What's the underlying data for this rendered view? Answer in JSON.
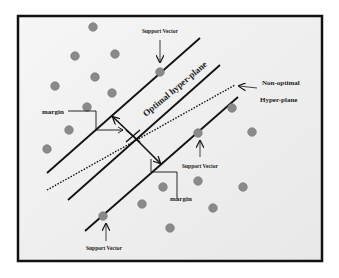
{
  "diagram": {
    "colors": {
      "background": "#f0f0f0",
      "frame": "#111111",
      "line": "#111111",
      "point": "#8a8a8a",
      "point_edge": "#777777"
    },
    "labels": {
      "support_vector_top": "Support Vector",
      "support_vector_mid": "Support Vector",
      "support_vector_bottom": "Support Vector",
      "optimal": "Optimal hyper-plane",
      "non_optimal_line1": "Non-optimal",
      "non_optimal_line2": "Hyper-plane",
      "margin_left": "margin",
      "margin_right": "margin"
    },
    "lines": {
      "upper_margin": {
        "x1": 47,
        "y1": 173,
        "x2": 200,
        "y2": 38
      },
      "optimal": {
        "x1": 68,
        "y1": 200,
        "x2": 220,
        "y2": 65
      },
      "lower_margin": {
        "x1": 85,
        "y1": 231,
        "x2": 238,
        "y2": 97
      },
      "non_optimal_dotted": {
        "x1": 47,
        "y1": 190,
        "x2": 235,
        "y2": 85
      }
    },
    "points_class_a": [
      [
        93,
        27
      ],
      [
        75,
        56
      ],
      [
        115,
        54
      ],
      [
        95,
        77
      ],
      [
        55,
        86
      ],
      [
        112,
        93
      ],
      [
        87,
        107
      ],
      [
        69,
        130
      ],
      [
        47,
        149
      ]
    ],
    "points_class_b": [
      [
        232,
        108
      ],
      [
        252,
        132
      ],
      [
        198,
        181
      ],
      [
        243,
        187
      ],
      [
        213,
        208
      ],
      [
        170,
        228
      ],
      [
        163,
        187
      ],
      [
        142,
        204
      ]
    ],
    "support_vectors": [
      [
        160,
        72
      ],
      [
        198,
        133
      ],
      [
        103,
        216
      ]
    ]
  }
}
